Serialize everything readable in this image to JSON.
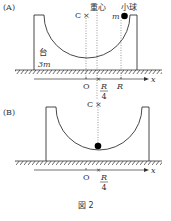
{
  "figure": {
    "caption": "図 2",
    "panels": [
      {
        "id": "A",
        "label": "(A)",
        "platform_label": "台",
        "platform_mass": "3m",
        "ball_label": "小球",
        "ball_mass": "m",
        "center_of_mass_label": "重心",
        "point_c": "C",
        "axis_label": "x",
        "ticks": [
          "O",
          "R",
          "4",
          "R"
        ],
        "tick_labels": {
          "origin": "O",
          "quarter_num": "R",
          "quarter_den": "4",
          "radius": "R"
        }
      },
      {
        "id": "B",
        "label": "(B)",
        "point_c": "C",
        "axis_label": "x",
        "tick_labels": {
          "origin": "O",
          "quarter_num": "R",
          "quarter_den": "4"
        }
      }
    ]
  },
  "colors": {
    "line": "#333333",
    "ball": "#000000",
    "dotted": "#555555"
  }
}
